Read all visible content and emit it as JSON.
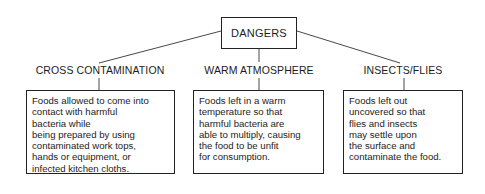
{
  "diagram": {
    "root": {
      "label": "DANGERS"
    },
    "branches": [
      {
        "heading": "CROSS CONTAMINATION",
        "description_lines": [
          "Foods allowed to come into",
          "contact with harmful",
          "bacteria while",
          "being prepared by using",
          "contaminated work tops,",
          "hands or equipment, or",
          "infected kitchen cloths."
        ]
      },
      {
        "heading": "WARM ATMOSPHERE",
        "description_lines": [
          "Foods left in a warm",
          "temperature so that",
          "harmful bacteria are",
          "able to multiply, causing",
          "the food to be unfit",
          "for consumption."
        ]
      },
      {
        "heading": "INSECTS/FLIES",
        "description_lines": [
          "Foods left out",
          "uncovered so that",
          "flies and insects",
          "may settle upon",
          "the surface and",
          "contaminate the food."
        ]
      }
    ],
    "colors": {
      "line": "#222222",
      "text": "#1c1c1c",
      "background": "#ffffff"
    }
  }
}
